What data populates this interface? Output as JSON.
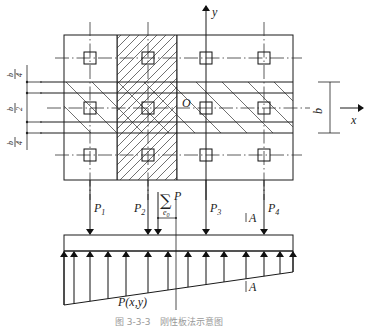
{
  "figure": {
    "caption": "图 3-3-3　刚性板法示意图",
    "axes": {
      "x_label": "x",
      "y_label": "y",
      "origin_label": "O"
    },
    "dimensions": {
      "left": [
        {
          "num": "b",
          "den": "4"
        },
        {
          "num": "b",
          "den": "2"
        },
        {
          "num": "b",
          "den": "4"
        }
      ],
      "right": "b"
    },
    "loads": [
      {
        "name": "P",
        "sub": "1"
      },
      {
        "name": "P",
        "sub": "2"
      },
      {
        "name": "P",
        "sub": "3"
      },
      {
        "name": "P",
        "sub": "4"
      }
    ],
    "resultant": {
      "symbol": "∑",
      "name": "P",
      "eccentricity": "e",
      "eccentricity_sub": "0"
    },
    "section_marks": [
      "A",
      "A"
    ],
    "pressure_label": "P(x,y)"
  }
}
